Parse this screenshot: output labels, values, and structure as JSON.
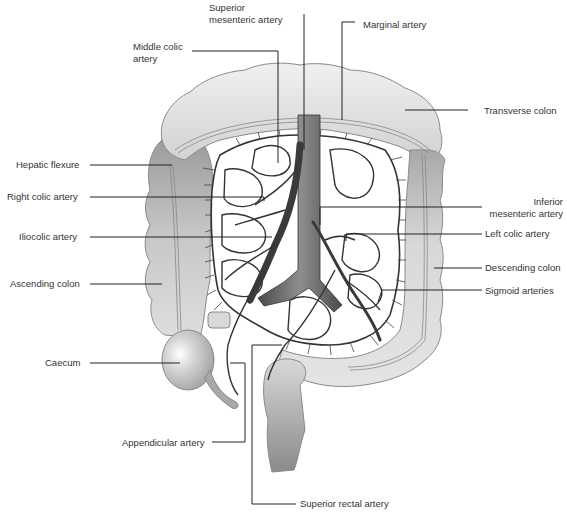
{
  "diagram": {
    "colors": {
      "colon_light": "#e6e6e6",
      "colon_dark": "#9a9a9a",
      "vessel": "#3a3a3a",
      "aorta": "#6e6e6e",
      "line": "#222222",
      "text": "#333333"
    },
    "labels": {
      "superior_mesenteric_artery": {
        "line1": "Superior",
        "line2": "mesenteric artery"
      },
      "middle_colic_artery": {
        "line1": "Middle colic",
        "line2": "artery"
      },
      "marginal_artery": "Marginal artery",
      "transverse_colon": "Transverse colon",
      "hepatic_flexure": "Hepatic flexure",
      "right_colic_artery": "Right colic artery",
      "iliocolic_artery": "Iliocolic artery",
      "ascending_colon": "Ascending colon",
      "caecum": "Caecum",
      "appendicular_artery": "Appendicular artery",
      "superior_rectal_artery": "Superior rectal artery",
      "inferior_mesenteric_artery": {
        "line1": "Inferior",
        "line2": "mesenteric artery"
      },
      "left_colic_artery": "Left colic artery",
      "descending_colon": "Descending colon",
      "sigmoid_arteries": "Sigmoid arteries"
    }
  }
}
